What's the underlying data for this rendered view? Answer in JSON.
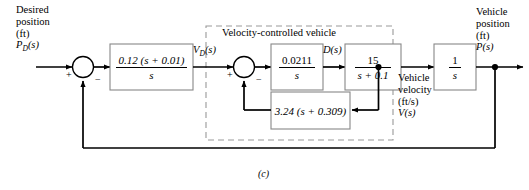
{
  "figure": {
    "caption": "(c)"
  },
  "dashed_group": {
    "label": "Velocity-controlled vehicle"
  },
  "inputs": {
    "desired_position": {
      "line1": "Desired",
      "line2": "position",
      "line3": "(ft)",
      "symbol_base": "P",
      "symbol_sub": "D",
      "symbol_tail": "(s)"
    }
  },
  "outputs": {
    "vehicle_position": {
      "line1": "Vehicle",
      "line2": "position",
      "line3": "(ft)",
      "symbol": "P(s)"
    }
  },
  "signals": {
    "vd": {
      "base": "V",
      "sub": "D",
      "tail": "(s)"
    },
    "d_of_s": "D(s)",
    "vehicle_velocity": {
      "line1": "Vehicle",
      "line2": "velocity",
      "line3": "(ft/s)",
      "symbol": "V(s)"
    }
  },
  "blocks": {
    "controller": {
      "numerator": "0.12 (s + 0.01)",
      "denominator": "s"
    },
    "velocity_gain": {
      "numerator": "0.0211",
      "denominator": "s"
    },
    "vehicle_dynamics": {
      "numerator": "15",
      "denominator": "s + 0.1"
    },
    "inner_feedback": {
      "expression": "3.24 (s + 0.309)"
    },
    "integrator": {
      "numerator": "1",
      "denominator": "s"
    }
  },
  "summing_junctions": {
    "outer": {
      "plus": "+",
      "minus": "−"
    },
    "inner": {
      "plus": "+",
      "minus": "−"
    }
  },
  "colors": {
    "line": "#000000",
    "block_border": "#888888",
    "dashed_border": "#999999",
    "background": "#ffffff"
  }
}
